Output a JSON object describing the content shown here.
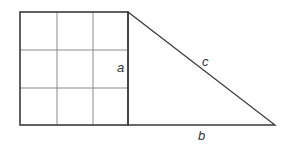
{
  "diagram": {
    "labels": {
      "a": "a",
      "b": "b",
      "c": "c"
    },
    "colors": {
      "outline": "#3a3a3a",
      "grid": "#8a8a8a",
      "label": "#333333"
    },
    "grid": {
      "rows": 3,
      "cols": 3
    }
  }
}
